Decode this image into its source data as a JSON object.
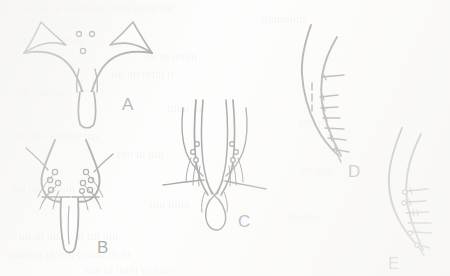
{
  "figure": {
    "kind": "scientific-line-drawing-plate",
    "medium": "scanned-book-page",
    "background_color": "#fbfbfa",
    "ink_color": "#1d1d1d",
    "panel_count": 5
  },
  "panels": [
    {
      "id": "A",
      "label": "A",
      "label_x": 122,
      "label_y": 95,
      "description": "ventral view of genital plate with paired lateral arms, median V-shaped notch and elongate median lobe",
      "feature_circles": 3
    },
    {
      "id": "B",
      "label": "B",
      "label_x": 97,
      "label_y": 238,
      "description": "ventral view of paired rounded lobes bearing clusters of setal bases with bristles, and an elongate median process",
      "feature_circles": 9
    },
    {
      "id": "C",
      "label": "C",
      "label_x": 238,
      "label_y": 212,
      "description": "ventral view of elongate paired parameres converging apically with lateral setal clusters and a terminal loop",
      "feature_circles": 6
    },
    {
      "id": "D",
      "label": "D",
      "label_x": 348,
      "label_y": 162,
      "description": "lateral view of sigmoid sclerite with a row of transverse spines along the posterior margin and a short dashed internal line",
      "spine_count": 7
    },
    {
      "id": "E",
      "label": "E",
      "label_x": 388,
      "label_y": 254,
      "description": "lateral view of sigmoid sclerite with a row of transverse spines and small circular setal bases along the distal margin",
      "spine_count": 6
    }
  ],
  "bleed_through_text": {
    "note": "faint illegible text showing through from the reverse side of the page",
    "lines": [
      {
        "x": 22,
        "y": 4,
        "text": "lllllllll lll ll lllllllllll llllll llllllll llll"
      },
      {
        "x": 262,
        "y": 15,
        "text": "llllllllllllll"
      },
      {
        "x": 12,
        "y": 36,
        "text": "lllll llll llll lllllll"
      },
      {
        "x": 148,
        "y": 52,
        "text": "lll lll llllllll"
      },
      {
        "x": 112,
        "y": 70,
        "text": "llll llll lllllll ll"
      },
      {
        "x": 18,
        "y": 88,
        "text": "llll lllll llll"
      },
      {
        "x": 168,
        "y": 104,
        "text": "lllllll llll"
      },
      {
        "x": 300,
        "y": 118,
        "text": "lllll lll"
      },
      {
        "x": 16,
        "y": 132,
        "text": "lll llll lllllllll ll lllll"
      },
      {
        "x": 118,
        "y": 150,
        "text": "lllll lll lllll"
      },
      {
        "x": 300,
        "y": 166,
        "text": "llll lllll"
      },
      {
        "x": 14,
        "y": 184,
        "text": "llll llll llll lllll lll"
      },
      {
        "x": 150,
        "y": 200,
        "text": "lllll lllllll"
      },
      {
        "x": 288,
        "y": 212,
        "text": "lllll llll"
      },
      {
        "x": 20,
        "y": 232,
        "text": "llll lll llll lll lll llll lllll"
      },
      {
        "x": 10,
        "y": 250,
        "text": "lllllll lll lll lllll lllllllll lll lll"
      },
      {
        "x": 86,
        "y": 266,
        "text": "lllll lll lllllll lll llllll"
      }
    ]
  }
}
